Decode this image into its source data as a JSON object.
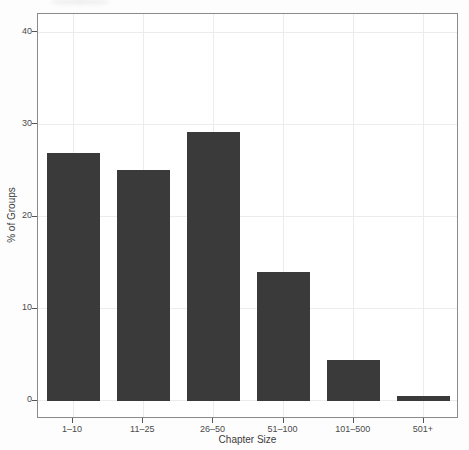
{
  "chart_data": {
    "type": "bar",
    "title": "",
    "xlabel": "Chapter Size",
    "ylabel": "% of Groups",
    "categories": [
      "1–10",
      "11–25",
      "26–50",
      "51–100",
      "101–500",
      "501+"
    ],
    "values": [
      26.9,
      25.0,
      29.2,
      14.0,
      4.4,
      0.5
    ],
    "yticks": [
      0,
      10,
      20,
      30,
      40
    ],
    "ylim": [
      0,
      40
    ],
    "axis_range": [
      -2,
      42
    ],
    "grid": "major horizontal at yticks, vertical at category centers",
    "legend": "none",
    "bar_width_fraction": 0.755,
    "colors": {
      "bar_fill": "#3a3a3a",
      "panel_border": "#8a8a8a",
      "gridline": "#ececec",
      "axis_text": "#4a4a4a",
      "tick_mark": "#555555",
      "background": "#ffffff"
    }
  }
}
